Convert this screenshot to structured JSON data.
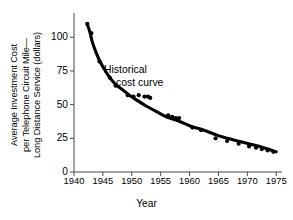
{
  "chart_data": {
    "type": "line",
    "title": "",
    "xlabel": "Year",
    "ylabel": "Average Investment Cost per Telephone Circuit Mile— Long Distance Service (dollars)",
    "ylabel_lines": [
      "Average Investment Cost",
      "per Telephone Circuit Mile—",
      "Long Distance Service (dollars)"
    ],
    "xlim": [
      1940,
      1976
    ],
    "ylim": [
      0,
      118
    ],
    "xticks": [
      1940,
      1945,
      1950,
      1955,
      1960,
      1965,
      1970,
      1975
    ],
    "xtick_labels": [
      "1940",
      "1945",
      "1950",
      "1955",
      "1960",
      "1965",
      "1970",
      "1975"
    ],
    "yticks": [
      0,
      25,
      50,
      75,
      100
    ],
    "ytick_labels": [
      "0",
      "25",
      "50",
      "75",
      "100"
    ],
    "grid": false,
    "legend": null,
    "annotations": [
      {
        "name": "historical-cost-curve",
        "lines": [
          "Historical",
          "cost curve"
        ],
        "x": 1950.5,
        "y": 72
      }
    ],
    "series": [
      {
        "name": "Historical cost curve",
        "type": "line",
        "color": "#000000",
        "x": [
          1942.3,
          1942.8,
          1943.2,
          1943.8,
          1944.5,
          1945.3,
          1946.2,
          1947.2,
          1948.4,
          1949.6,
          1951.0,
          1952.5,
          1954.2,
          1956.0,
          1958.0,
          1960.2,
          1962.5,
          1965.0,
          1967.5,
          1970.2,
          1972.8,
          1975.0
        ],
        "y": [
          110,
          103,
          96,
          89,
          82,
          76,
          70,
          65,
          61,
          57,
          53,
          49,
          45,
          41,
          38,
          34,
          31,
          27,
          24,
          21,
          18,
          15
        ]
      },
      {
        "name": "Observed data points",
        "type": "scatter",
        "color": "#000000",
        "x": [
          1942.3,
          1943.0,
          1944.4,
          1946.2,
          1947.2,
          1949.3,
          1950.3,
          1951.2,
          1952.2,
          1952.8,
          1953.2,
          1956.3,
          1957.0,
          1957.6,
          1958.2,
          1960.5,
          1962.0,
          1964.5,
          1966.5,
          1968.5,
          1970.3,
          1971.5,
          1972.5,
          1973.5,
          1974.5
        ],
        "y": [
          110,
          103,
          82,
          70,
          64,
          57,
          56,
          57,
          56,
          56,
          55,
          42,
          41,
          40,
          40,
          33,
          31,
          25,
          23,
          21,
          19,
          18,
          17,
          16,
          15
        ]
      }
    ]
  }
}
